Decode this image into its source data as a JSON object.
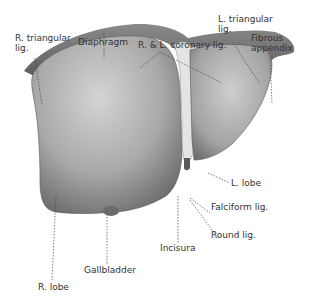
{
  "figure": {
    "labels": {
      "r_triangular_lig": [
        "R. triangular",
        "lig."
      ],
      "diaphragm": "Diaphragm",
      "coronary_lig": "R. & L. coronary lig.",
      "l_triangular_lig": [
        "L. triangular",
        "lig."
      ],
      "fibrous_appendix": [
        "Fibrous",
        "appendix"
      ],
      "l_lobe": "L. lobe",
      "falciform_lig": "Falciform lig.",
      "round_lig": "Round lig.",
      "incisura": "Incisura",
      "gallbladder": "Gallbladder",
      "r_lobe": "R. lobe"
    },
    "colors": {
      "tissue_dark": "#6a6a6a",
      "tissue_mid": "#a8a8a8",
      "tissue_light": "#d8d8d8",
      "text": "#333333"
    }
  }
}
